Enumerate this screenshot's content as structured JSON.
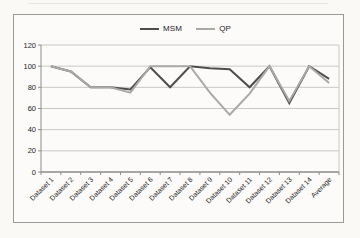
{
  "chart_data": {
    "type": "line",
    "title": "",
    "xlabel": "",
    "ylabel": "",
    "categories": [
      "Dataset 1",
      "Dataset 2",
      "Dataset 3",
      "Dataset 4",
      "Dataset 5",
      "Dataset 6",
      "Dataset 7",
      "Dataset 8",
      "Dataset 9",
      "Dataset 10",
      "Dataset 11",
      "Dataset 12",
      "Dataset 13",
      "Dataset 14",
      "Average"
    ],
    "series": [
      {
        "name": "MSM",
        "color": "#4d4d4d",
        "values": [
          100,
          95,
          80,
          80,
          78,
          99,
          80,
          100,
          98,
          97,
          80,
          100,
          65,
          100,
          88
        ]
      },
      {
        "name": "QP",
        "color": "#a9a9a9",
        "values": [
          100,
          95,
          80,
          80,
          75,
          100,
          100,
          100,
          75,
          54,
          74,
          100,
          67,
          100,
          84
        ]
      }
    ],
    "ylim": [
      0,
      120
    ],
    "yticks": [
      0,
      20,
      40,
      60,
      80,
      100,
      120
    ],
    "grid": true,
    "legend_position": "top",
    "colors": {
      "gridline": "#c9c8c4",
      "axis": "#8c8c88",
      "tick_text": "#1c1c1c"
    }
  }
}
